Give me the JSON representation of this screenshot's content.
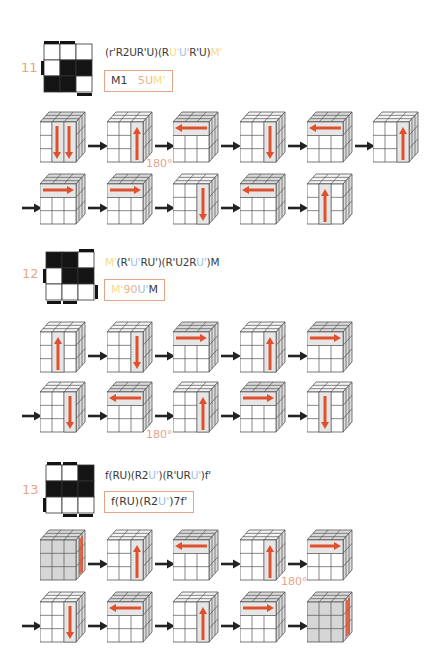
{
  "colors": {
    "accent_red": "#e0502e",
    "label_orange": "#e8a487",
    "yellow_seg": "#f3dc8c",
    "blue_seg": "#9ec0e6",
    "text": "#3a3a3a"
  },
  "sections": [
    {
      "number": "11",
      "pattern": [
        [
          0,
          0,
          0
        ],
        [
          0,
          1,
          1
        ],
        [
          1,
          1,
          0
        ]
      ],
      "formula_segments": [
        {
          "text": "(r'R2UR'U)(R",
          "color": "text"
        },
        {
          "text": "U'",
          "color": "yellow"
        },
        {
          "text": "U'",
          "color": "blue"
        },
        {
          "text": "R'U)",
          "color": "text"
        },
        {
          "text": "M'",
          "color": "yellow"
        }
      ],
      "short_segments": [
        {
          "text": "M1",
          "color": "text"
        },
        {
          "text": "   ",
          "color": "text"
        },
        {
          "text": "5U",
          "color": "orange"
        },
        {
          "text": "M'",
          "color": "yellow"
        }
      ],
      "rows": [
        {
          "leading_arrow": false,
          "steps": [
            "double-down-center",
            "up-right",
            "left-top",
            "down-right",
            "left-top",
            "up-right"
          ],
          "rotation_label": "180°",
          "rotation_after_index": 1
        },
        {
          "leading_arrow": true,
          "steps": [
            "right-top",
            "right-top",
            "down-right",
            "left-top",
            "up-center"
          ]
        }
      ]
    },
    {
      "number": "12",
      "pattern": [
        [
          1,
          1,
          0
        ],
        [
          0,
          1,
          1
        ],
        [
          0,
          0,
          0
        ]
      ],
      "formula_segments": [
        {
          "text": "M'",
          "color": "yellow"
        },
        {
          "text": "(R'",
          "color": "text"
        },
        {
          "text": "U'",
          "color": "blue"
        },
        {
          "text": "RU'",
          "color": "text"
        },
        {
          "text": ")(R'U2R",
          "color": "text"
        },
        {
          "text": "U'",
          "color": "blue"
        },
        {
          "text": ")M",
          "color": "text"
        }
      ],
      "short_segments": [
        {
          "text": "M'",
          "color": "yellow"
        },
        {
          "text": "90",
          "color": "orange"
        },
        {
          "text": "U'",
          "color": "blue"
        },
        {
          "text": "M",
          "color": "text"
        }
      ],
      "rows": [
        {
          "leading_arrow": false,
          "steps": [
            "up-center",
            "down-right",
            "right-top",
            "up-right",
            "right-top"
          ]
        },
        {
          "leading_arrow": true,
          "steps": [
            "down-right",
            "left-top",
            "up-right",
            "right-top",
            "down-center"
          ],
          "rotation_label": "180°",
          "rotation_after_index": 1
        }
      ]
    },
    {
      "number": "13",
      "pattern": [
        [
          0,
          0,
          1
        ],
        [
          1,
          1,
          1
        ],
        [
          0,
          0,
          0
        ]
      ],
      "formula_segments": [
        {
          "text": "f(RU)(R2",
          "color": "text"
        },
        {
          "text": "U'",
          "color": "blue"
        },
        {
          "text": ")(R'UR",
          "color": "text"
        },
        {
          "text": "U'",
          "color": "blue"
        },
        {
          "text": ")f'",
          "color": "text"
        }
      ],
      "short_segments": [
        {
          "text": "f(RU)(R2",
          "color": "text"
        },
        {
          "text": "U'",
          "color": "blue"
        },
        {
          "text": ")7f'",
          "color": "text"
        }
      ],
      "rows": [
        {
          "leading_arrow": false,
          "steps": [
            "gray-side",
            "up-right",
            "left-top",
            "up-right",
            "right-top"
          ],
          "rotation_label": "180°",
          "rotation_after_index": 3
        },
        {
          "leading_arrow": true,
          "steps": [
            "down-right",
            "left-top",
            "up-right",
            "right-top",
            "gray-side"
          ]
        }
      ]
    }
  ]
}
